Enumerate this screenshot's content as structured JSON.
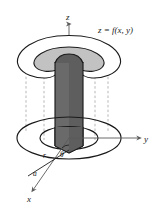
{
  "figure": {
    "type": "diagram",
    "background_color": "#ffffff",
    "width": 159,
    "height": 208
  },
  "labels": {
    "z_axis": "z",
    "y_axis": "y",
    "x_axis": "x",
    "surface_equation": "z = f(x, y)",
    "radius_r": "r",
    "angle_theta": "θ",
    "radius_a": "a"
  },
  "colors": {
    "stroke": "#1a1a1a",
    "axis": "#5a5a5a",
    "dashed_guide": "#9a9a9a",
    "cylinder_fill": "#5e5e5e",
    "cylinder_fill_light": "#6e6e6e",
    "cap_fill": "#c2c2c2",
    "surface_fill": "#ffffff",
    "background": "#ffffff"
  },
  "elements": {
    "surface": "z = f(x, y)",
    "cap_region": "shaded patch of surface above cylinder",
    "cylinder": "vertical dark solid cylinder of radius a",
    "base_outer_ellipse": "projected boundary of surface region in xy-plane",
    "base_inner_ellipse": "circle of radius a in xy-plane",
    "dashed_guides": "vertical projection lines from surface edge to base",
    "polar_ray": "ray from origin at angle theta with length r"
  }
}
